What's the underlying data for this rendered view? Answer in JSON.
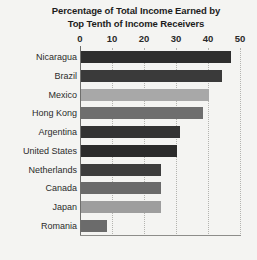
{
  "chart_data": {
    "type": "bar",
    "orientation": "horizontal",
    "title": "Percentage of Total Income Earned by Top Tenth of Income Receivers",
    "title_lines": [
      "Percentage of Total Income Earned by",
      "Top Tenth of Income Receivers"
    ],
    "xlabel": "",
    "ylabel": "",
    "xlim": [
      0,
      50
    ],
    "xticks": [
      0,
      10,
      20,
      30,
      40,
      50
    ],
    "xtick_labels": [
      "0",
      "10",
      "20",
      "30",
      "40",
      "50"
    ],
    "grid": true,
    "grid_axis": "x",
    "legend": false,
    "categories": [
      "Nicaragua",
      "Brazil",
      "Mexico",
      "Hong Kong",
      "Argentina",
      "United States",
      "Netherlands",
      "Canada",
      "Japan",
      "Romania"
    ],
    "values": [
      47,
      44,
      40,
      38,
      31,
      30,
      25,
      25,
      25,
      8
    ],
    "bar_colors": [
      "#2e2e2e",
      "#3a3a3a",
      "#a8a8a8",
      "#6e6e6e",
      "#333333",
      "#2b2b2b",
      "#3d3d3d",
      "#6a6a6a",
      "#9e9e9e",
      "#6b6b6b"
    ],
    "bars": [
      {
        "category": "Nicaragua",
        "value": 47,
        "color": "#2e2e2e"
      },
      {
        "category": "Brazil",
        "value": 44,
        "color": "#3a3a3a"
      },
      {
        "category": "Mexico",
        "value": 40,
        "color": "#a8a8a8"
      },
      {
        "category": "Hong Kong",
        "value": 38,
        "color": "#6e6e6e"
      },
      {
        "category": "Argentina",
        "value": 31,
        "color": "#333333"
      },
      {
        "category": "United States",
        "value": 30,
        "color": "#2b2b2b"
      },
      {
        "category": "Netherlands",
        "value": 25,
        "color": "#3d3d3d"
      },
      {
        "category": "Canada",
        "value": 25,
        "color": "#6a6a6a"
      },
      {
        "category": "Japan",
        "value": 25,
        "color": "#9e9e9e"
      },
      {
        "category": "Romania",
        "value": 8,
        "color": "#6b6b6b"
      }
    ]
  },
  "style": {
    "background": "#f4f4f2",
    "grid_color": "#b4b4b0",
    "axis_color": "#6f6f6d",
    "text_color": "#2b2b2b"
  }
}
